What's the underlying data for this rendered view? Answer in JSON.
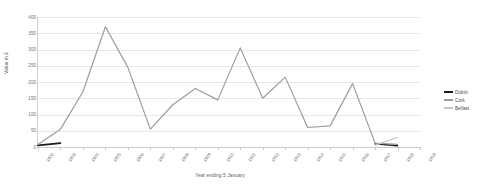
{
  "chart_data": {
    "type": "line",
    "title": "",
    "xlabel": "Year ending 5 January",
    "ylabel": "Value in £",
    "ylim": [
      0,
      400
    ],
    "ytick_step": 50,
    "yticks": [
      0,
      50,
      100,
      150,
      200,
      250,
      300,
      350,
      400
    ],
    "grid": true,
    "legend_position": "right",
    "categories": [
      "1902",
      "1903",
      "1904",
      "1905",
      "1906",
      "1907",
      "1908",
      "1909",
      "1910",
      "1911",
      "1912",
      "1913",
      "1914",
      "1915",
      "1916",
      "1917",
      "1918",
      "1919"
    ],
    "series": [
      {
        "name": "Dublin",
        "color": "#1a1a1a",
        "values": [
          5,
          12,
          null,
          null,
          null,
          null,
          null,
          null,
          null,
          null,
          null,
          8,
          null,
          null,
          null,
          10,
          4,
          null
        ]
      },
      {
        "name": "Cork",
        "color": "#9a9c9f",
        "values": [
          8,
          55,
          170,
          370,
          245,
          55,
          130,
          180,
          145,
          305,
          150,
          215,
          60,
          65,
          195,
          12,
          8,
          null
        ]
      },
      {
        "name": "Belfast",
        "color": "#c4c6c9",
        "values": [
          null,
          null,
          null,
          null,
          null,
          null,
          null,
          null,
          null,
          null,
          null,
          null,
          null,
          null,
          null,
          5,
          30,
          null
        ]
      }
    ]
  },
  "legend": {
    "items": [
      {
        "label": "Dublin",
        "color": "#1a1a1a"
      },
      {
        "label": "Cork",
        "color": "#9a9c9f"
      },
      {
        "label": "Belfast",
        "color": "#c4c6c9"
      }
    ]
  },
  "axes": {
    "y_title": "Value in £",
    "x_title": "Year ending 5 January",
    "y_labels": [
      "400",
      "350",
      "300",
      "250",
      "200",
      "150",
      "100",
      "50",
      "0"
    ],
    "x_labels": [
      "1902",
      "1903",
      "1904",
      "1905",
      "1906",
      "1907",
      "1908",
      "1909",
      "1910",
      "1911",
      "1912",
      "1913",
      "1914",
      "1915",
      "1916",
      "1917",
      "1918",
      "1919"
    ]
  }
}
